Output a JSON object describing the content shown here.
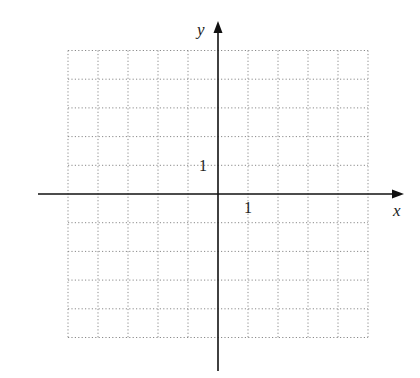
{
  "diagram": {
    "type": "coordinate-grid",
    "axes": {
      "x_label": "x",
      "y_label": "y"
    },
    "tick_labels": {
      "x_unit": "1",
      "y_unit": "1"
    },
    "grid": {
      "x_range": [
        -5,
        5
      ],
      "y_range": [
        -5,
        5
      ],
      "step": 1,
      "style": "dotted"
    },
    "colors": {
      "axis": "#111111",
      "grid": "#8a8a8a",
      "background": "#ffffff"
    }
  }
}
